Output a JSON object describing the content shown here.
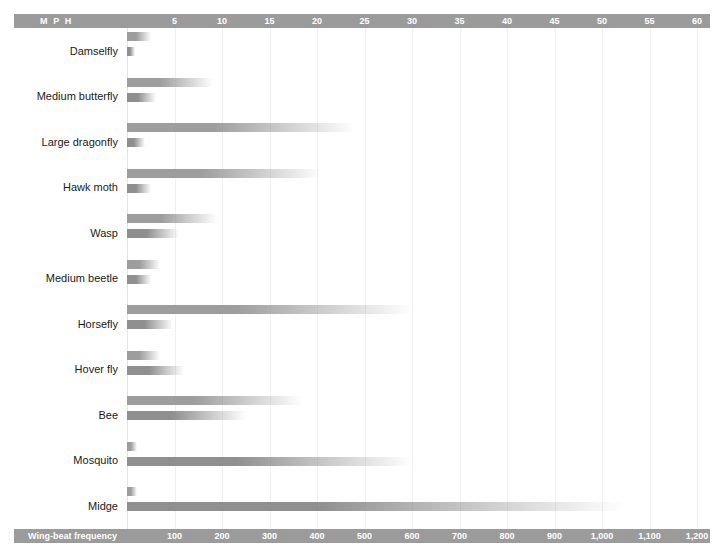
{
  "top_axis": {
    "title": "M P H",
    "ticks": [
      5,
      10,
      15,
      20,
      25,
      30,
      35,
      40,
      45,
      50,
      55,
      60
    ],
    "tick_labels": [
      "5",
      "10",
      "15",
      "20",
      "25",
      "30",
      "35",
      "40",
      "45",
      "50",
      "55",
      "60"
    ]
  },
  "bottom_axis": {
    "title": "Wing-beat frequency",
    "ticks": [
      100,
      200,
      300,
      400,
      500,
      600,
      700,
      800,
      900,
      1000,
      1100,
      1200
    ],
    "tick_labels": [
      "100",
      "200",
      "300",
      "400",
      "500",
      "600",
      "700",
      "800",
      "900",
      "1,000",
      "1,100",
      "1,200"
    ]
  },
  "colors": {
    "axis_bar": "#9b9b9b",
    "axis_text": "#ffffff",
    "bar_mph": "#9d9d9d",
    "bar_wbf": "#8f8f8f",
    "gridline": "#f0f0f0",
    "label_text": "#1a1a1a",
    "background": "#ffffff"
  },
  "chart_data": {
    "type": "bar",
    "title": "",
    "subtitle": "",
    "xlabel": "",
    "ylabel": "",
    "orientation": "horizontal",
    "grid": true,
    "legend": "none",
    "categories": [
      "Damselfly",
      "Medium butterfly",
      "Large dragonfly",
      "Hawk moth",
      "Wasp",
      "Medium beetle",
      "Horsefly",
      "Hover fly",
      "Bee",
      "Mosquito",
      "Midge"
    ],
    "series": [
      {
        "name": "M P H",
        "axis": "top",
        "unit": "mph",
        "xlim": [
          0,
          63
        ],
        "values": [
          2.5,
          9,
          24,
          20.5,
          9.5,
          3.5,
          30,
          3.5,
          18.5,
          1,
          1
        ]
      },
      {
        "name": "Wing-beat frequency",
        "axis": "bottom",
        "unit": "beats per second",
        "xlim": [
          0,
          1260
        ],
        "values": [
          16,
          60,
          38,
          50,
          110,
          50,
          96,
          120,
          250,
          600,
          1046
        ]
      }
    ]
  }
}
